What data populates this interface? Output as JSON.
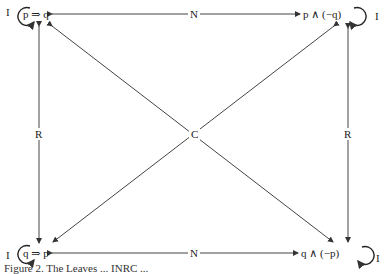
{
  "nodes": {
    "top_left": {
      "label": "p ⇒ q",
      "loop_label": "I"
    },
    "top_right": {
      "label": "p ∧ (−q)",
      "loop_label": "I"
    },
    "bottom_left": {
      "label": "q ⇒ p",
      "loop_label": "I"
    },
    "bottom_right": {
      "label": "q ∧ (−p)",
      "loop_label": "I"
    }
  },
  "edges": {
    "top": {
      "label": "N"
    },
    "bottom": {
      "label": "N"
    },
    "left": {
      "label": "R"
    },
    "right": {
      "label": "R"
    },
    "diagonal": {
      "label": "C"
    }
  },
  "caption": "Figure 2. The Leaves ... INRC ..."
}
